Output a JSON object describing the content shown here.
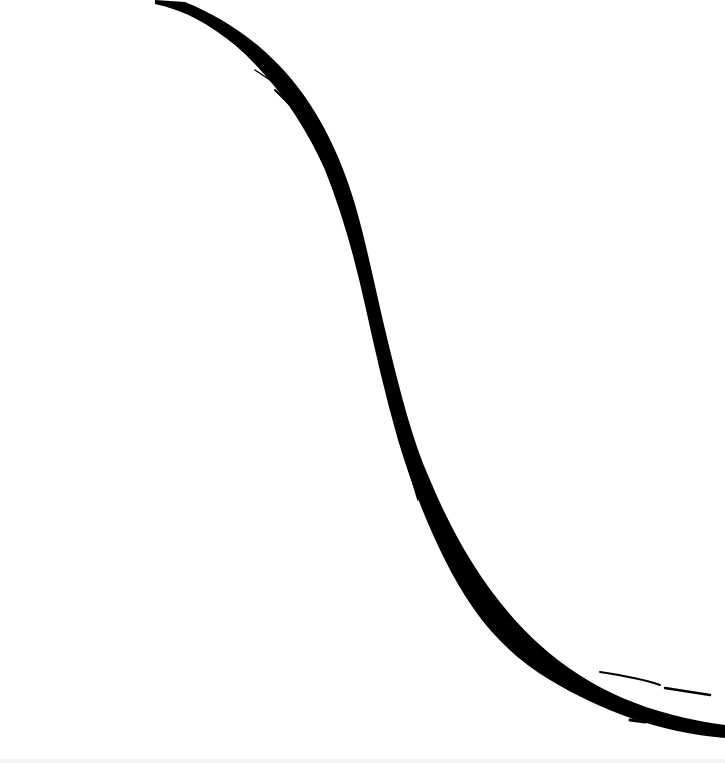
{
  "artwork": {
    "subject": "brush-stroke-s-curve",
    "background_color": "#ffffff",
    "ink_color": "#000000",
    "stroke_description": "Single calligraphic black ink brush stroke forming a descending S-curve from top-left to bottom-right"
  }
}
